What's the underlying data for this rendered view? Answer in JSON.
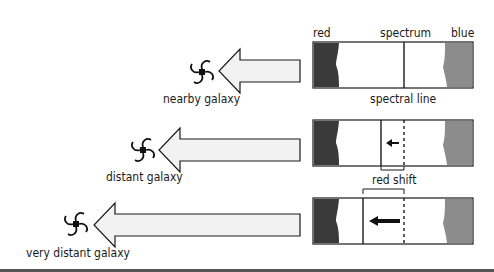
{
  "colors": {
    "red_band": "#3a3a3a",
    "blue_band": "#8c8c8c",
    "arrow_fill": "#f2f2f2",
    "outline": "#1a1a1a",
    "bottom_rule": "#555555"
  },
  "labels": {
    "red": "red",
    "spectrum": "spectrum",
    "blue": "blue",
    "spectral_line": "spectral line",
    "red_shift": "red shift"
  },
  "rows": [
    {
      "galaxy_label": "nearby galaxy",
      "shift": 0
    },
    {
      "galaxy_label": "distant galaxy",
      "shift": 1
    },
    {
      "galaxy_label": "very distant galaxy",
      "shift": 2
    }
  ]
}
